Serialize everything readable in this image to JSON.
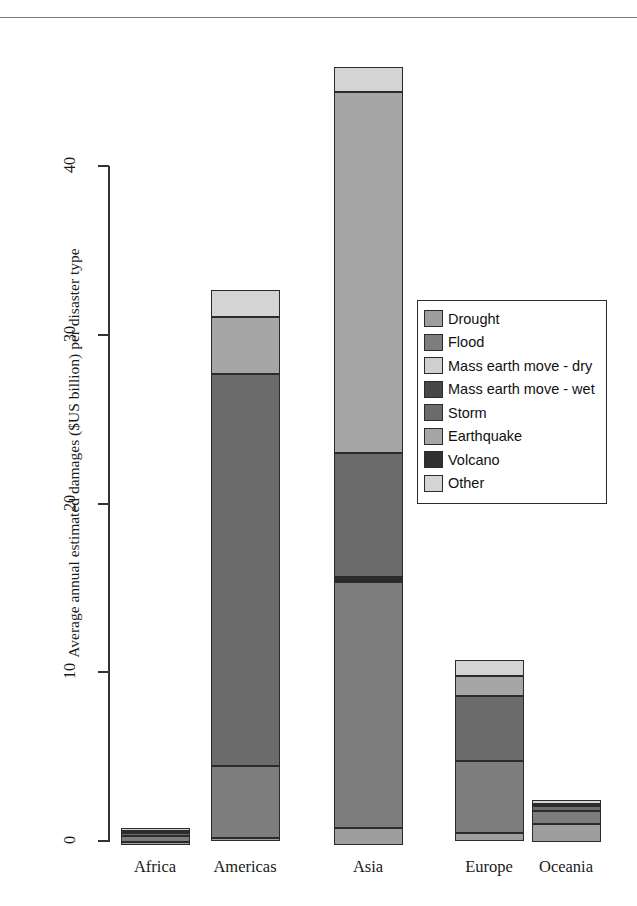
{
  "figure": {
    "clipped_header_text": "Figure caption text clipped at top of page",
    "y_axis_title": "Average annual estimated damages ($US billion) per disaster type"
  },
  "chart_data": {
    "type": "bar",
    "subtype": "stacked-bar",
    "title": "",
    "xlabel": "",
    "ylabel": "Average annual estimated damages ($US billion) per disaster type",
    "categories": [
      "Africa",
      "Americas",
      "Asia",
      "Europe",
      "Oceania"
    ],
    "ylim": [
      0,
      46.5
    ],
    "yticks": [
      0,
      10,
      20,
      30,
      40
    ],
    "ytick_labels": [
      "0",
      "10",
      "20",
      "30",
      "40"
    ],
    "grid": false,
    "legend_position": "center-right",
    "legend_entries": [
      "Drought",
      "Flood",
      "Mass earth move - dry",
      "Mass earth move - wet",
      "Storm",
      "Earthquake",
      "Volcano",
      "Other"
    ],
    "series": [
      {
        "name": "Drought",
        "color": "#9e9e9e",
        "values": [
          0.1,
          0.15,
          0.95,
          0.5,
          1.05
        ]
      },
      {
        "name": "Flood",
        "color": "#7d7d7d",
        "values": [
          0.35,
          4.3,
          14.6,
          4.25,
          0.8
        ]
      },
      {
        "name": "Mass earth move - dry",
        "color": "#cfcfcf",
        "values": [
          0.0,
          0.0,
          0.0,
          0.0,
          0.0
        ]
      },
      {
        "name": "Mass earth move - wet",
        "color": "#474747",
        "values": [
          0.0,
          0.0,
          0.05,
          0.0,
          0.0
        ]
      },
      {
        "name": "Storm",
        "color": "#6b6b6b",
        "values": [
          0.05,
          23.25,
          7.35,
          3.85,
          0.25
        ]
      },
      {
        "name": "Earthquake",
        "color": "#a6a6a6",
        "values": [
          0.1,
          3.35,
          21.4,
          1.2,
          0.1
        ]
      },
      {
        "name": "Volcano",
        "color": "#303030",
        "values": [
          0.0,
          0.0,
          0.05,
          0.0,
          0.0
        ]
      },
      {
        "name": "Other",
        "color": "#d4d4d4",
        "values": [
          0.2,
          1.6,
          1.45,
          0.9,
          0.25
        ]
      }
    ],
    "totals": [
      0.8,
      32.65,
      45.85,
      10.7,
      2.45
    ],
    "bars": [
      {
        "category": "Africa",
        "total": 0.8,
        "segments": [
          {
            "name": "Other",
            "value": 0.2,
            "color": "#d4d4d4"
          },
          {
            "name": "Earthquake",
            "value": 0.1,
            "color": "#a6a6a6"
          },
          {
            "name": "Storm",
            "value": 0.05,
            "color": "#6b6b6b"
          },
          {
            "name": "Flood",
            "value": 0.35,
            "color": "#7d7d7d"
          },
          {
            "name": "Drought",
            "value": 0.1,
            "color": "#9e9e9e"
          }
        ]
      },
      {
        "category": "Americas",
        "total": 32.65,
        "segments": [
          {
            "name": "Other",
            "value": 1.6,
            "color": "#d4d4d4"
          },
          {
            "name": "Earthquake",
            "value": 3.35,
            "color": "#a6a6a6"
          },
          {
            "name": "Storm",
            "value": 23.25,
            "color": "#6b6b6b"
          },
          {
            "name": "Flood",
            "value": 4.3,
            "color": "#7d7d7d"
          },
          {
            "name": "Drought",
            "value": 0.15,
            "color": "#9e9e9e"
          }
        ]
      },
      {
        "category": "Asia",
        "total": 45.85,
        "segments": [
          {
            "name": "Other",
            "value": 1.45,
            "color": "#d4d4d4"
          },
          {
            "name": "Earthquake",
            "value": 21.4,
            "color": "#a6a6a6"
          },
          {
            "name": "Storm",
            "value": 7.35,
            "color": "#6b6b6b"
          },
          {
            "name": "Volcano",
            "value": 0.05,
            "color": "#303030"
          },
          {
            "name": "Mass earth move - wet",
            "value": 0.05,
            "color": "#474747"
          },
          {
            "name": "Flood",
            "value": 14.6,
            "color": "#7d7d7d"
          },
          {
            "name": "Drought",
            "value": 0.95,
            "color": "#9e9e9e"
          }
        ]
      },
      {
        "category": "Europe",
        "total": 10.7,
        "segments": [
          {
            "name": "Other",
            "value": 0.9,
            "color": "#d4d4d4"
          },
          {
            "name": "Earthquake",
            "value": 1.2,
            "color": "#a6a6a6"
          },
          {
            "name": "Storm",
            "value": 3.85,
            "color": "#6b6b6b"
          },
          {
            "name": "Flood",
            "value": 4.25,
            "color": "#7d7d7d"
          },
          {
            "name": "Drought",
            "value": 0.5,
            "color": "#9e9e9e"
          }
        ]
      },
      {
        "category": "Oceania",
        "total": 2.45,
        "segments": [
          {
            "name": "Other",
            "value": 0.25,
            "color": "#d4d4d4"
          },
          {
            "name": "Earthquake",
            "value": 0.1,
            "color": "#a6a6a6"
          },
          {
            "name": "Storm",
            "value": 0.25,
            "color": "#6b6b6b"
          },
          {
            "name": "Flood",
            "value": 0.8,
            "color": "#7d7d7d"
          },
          {
            "name": "Drought",
            "value": 1.05,
            "color": "#9e9e9e"
          }
        ]
      }
    ]
  },
  "legend": {
    "items": [
      {
        "label": "Drought",
        "color": "#9e9e9e"
      },
      {
        "label": "Flood",
        "color": "#7d7d7d"
      },
      {
        "label": "Mass earth move - dry",
        "color": "#cfcfcf"
      },
      {
        "label": "Mass earth move - wet",
        "color": "#474747"
      },
      {
        "label": "Storm",
        "color": "#6b6b6b"
      },
      {
        "label": "Earthquake",
        "color": "#a6a6a6"
      },
      {
        "label": "Volcano",
        "color": "#303030"
      },
      {
        "label": "Other",
        "color": "#d4d4d4"
      }
    ]
  },
  "axis": {
    "y_ticks": [
      "0",
      "10",
      "20",
      "30",
      "40"
    ],
    "x_labels": [
      "Africa",
      "Americas",
      "Asia",
      "Europe",
      "Oceania"
    ]
  },
  "colors": {
    "axis": "#333333",
    "outline": "#2b2b2b",
    "background": "#ffffff"
  }
}
